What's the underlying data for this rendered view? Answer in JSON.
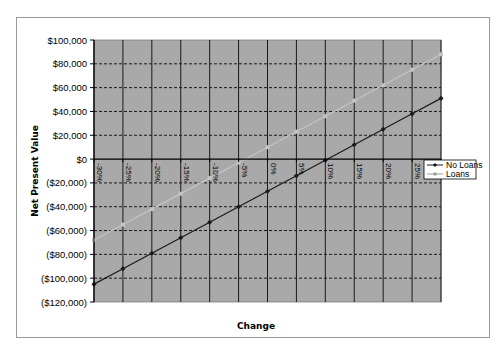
{
  "chart_data": {
    "type": "line",
    "title": "",
    "xlabel": "Change",
    "ylabel": "Net Present Value",
    "categories": [
      "-30%",
      "-25%",
      "-20%",
      "-15%",
      "-10%",
      "-5%",
      "0%",
      "5%",
      "10%",
      "15%",
      "20%",
      "25%",
      "30%"
    ],
    "series": [
      {
        "name": "No Loans",
        "color": "#1a1a1a",
        "marker": "diamond",
        "values": [
          -105000,
          -92000,
          -79000,
          -66000,
          -53000,
          -40000,
          -27000,
          -14000,
          -1000,
          12000,
          25000,
          38000,
          51000
        ]
      },
      {
        "name": "Loans",
        "color": "#c4c4c4",
        "marker": "square",
        "values": [
          -68000,
          -55000,
          -42000,
          -29000,
          -16000,
          -3000,
          10000,
          23000,
          36000,
          49000,
          62000,
          75000,
          88000
        ]
      }
    ],
    "ylim": [
      -120000,
      100000
    ],
    "yticks": [
      100000,
      80000,
      60000,
      40000,
      20000,
      0,
      -20000,
      -40000,
      -60000,
      -80000,
      -100000,
      -120000
    ],
    "ytick_labels": [
      "$100,000",
      "$80,000",
      "$60,000",
      "$40,000",
      "$20,000",
      "$0",
      "($20,000)",
      "($40,000)",
      "($60,000)",
      "($80,000)",
      "($100,000)",
      "($120,000)"
    ],
    "grid": {
      "horizontal": "dashed",
      "vertical": "solid"
    },
    "legend_position": "right",
    "plot_background": "#a9a9a9"
  },
  "legend": {
    "items": [
      {
        "label": "No Loans"
      },
      {
        "label": "Loans"
      }
    ]
  }
}
